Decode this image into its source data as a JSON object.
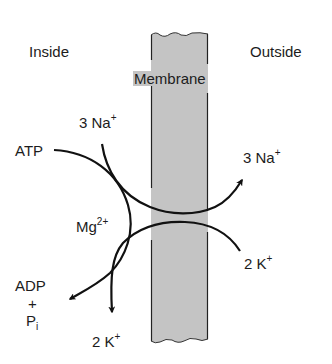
{
  "diagram": {
    "regions": {
      "inside": "Inside",
      "outside": "Outside",
      "membrane": "Membrane"
    },
    "labels": {
      "na_in": {
        "text": "3 Na",
        "charge": "+"
      },
      "na_out": {
        "text": "3 Na",
        "charge": "+"
      },
      "k_out": {
        "text": "2 K",
        "charge": "+"
      },
      "k_in": {
        "text": "2 K",
        "charge": "+"
      },
      "atp": "ATP",
      "mg": {
        "text": "Mg",
        "charge": "2+"
      },
      "adp": "ADP",
      "plus": "+",
      "pi": {
        "text": "P",
        "subscript": "i"
      }
    },
    "colors": {
      "membrane_fill": "#c4c4c4",
      "stroke": "#111111",
      "text": "#1c1c1c"
    }
  }
}
